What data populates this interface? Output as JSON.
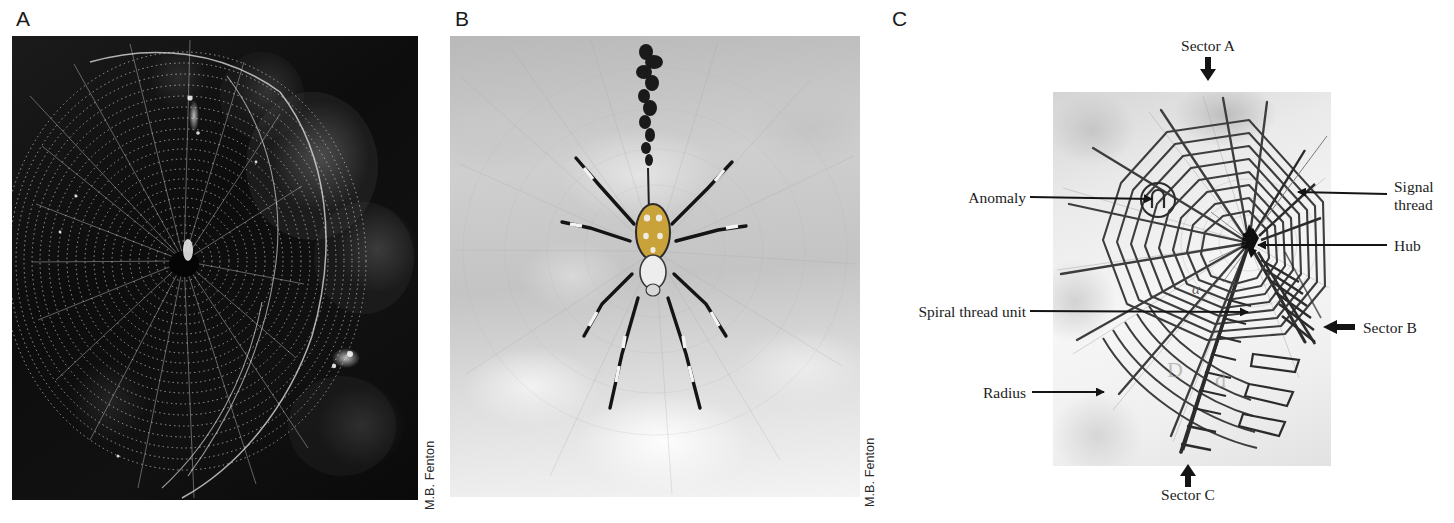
{
  "figure": {
    "panels": [
      {
        "letter": "A",
        "credit": "M.B. Fenton",
        "subject": "orb web photographed against dark background"
      },
      {
        "letter": "B",
        "credit": "M.B. Fenton",
        "subject": "orb-weaving spider at hub of web with stabilimentum"
      },
      {
        "letter": "C",
        "credit": "",
        "subject": "annotated diagram of orb web structure"
      }
    ]
  },
  "panelA": {
    "letter": "A",
    "credit": "M.B. Fenton"
  },
  "panelB": {
    "letter": "B",
    "credit": "M.B. Fenton"
  },
  "panelC": {
    "letter": "C",
    "angle_symbol": "α",
    "watermark_left": "D",
    "watermark_right": "d",
    "annotations": {
      "sector_a": "Sector A",
      "sector_b": "Sector B",
      "sector_c": "Sector C",
      "anomaly": "Anomaly",
      "signal_thread_line1": "Signal",
      "signal_thread_line2": "thread",
      "hub": "Hub",
      "spiral_thread_unit": "Spiral thread unit",
      "radius": "Radius"
    }
  },
  "colors": {
    "ink": "#1c1c1c",
    "panel_letter": "#1a1a1a",
    "credit": "#2b2b2b",
    "arrow": "#141414",
    "web_line": "#4a4a4a",
    "page_background": "#ffffff"
  }
}
